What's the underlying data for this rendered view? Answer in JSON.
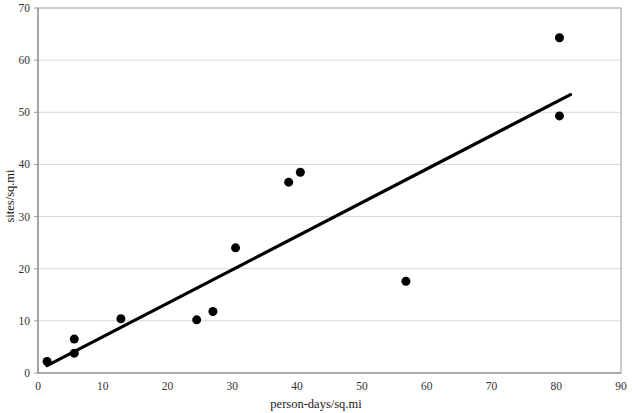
{
  "chart_data": {
    "type": "scatter",
    "title": "",
    "xlabel": "person-days/sq.mi",
    "ylabel": "sites/sq.mi",
    "xlim": [
      0,
      90
    ],
    "ylim": [
      0,
      70
    ],
    "xticks": [
      0,
      10,
      20,
      30,
      40,
      50,
      60,
      70,
      80,
      90
    ],
    "yticks": [
      0,
      10,
      20,
      30,
      40,
      50,
      60,
      70
    ],
    "xtick_labels": [
      "0",
      "10",
      "20",
      "30",
      "40",
      "50",
      "60",
      "70",
      "80",
      "90"
    ],
    "ytick_labels": [
      "0",
      "10",
      "20",
      "30",
      "40",
      "50",
      "60",
      "70"
    ],
    "grid": "horizontal",
    "legend": "none",
    "marker_color": "#000000",
    "marker_size": 9,
    "line_color": "#000000",
    "series": [
      {
        "name": "observations",
        "points": [
          {
            "x": 1.4,
            "y": 2.2
          },
          {
            "x": 5.6,
            "y": 6.5
          },
          {
            "x": 5.6,
            "y": 3.8
          },
          {
            "x": 12.8,
            "y": 10.4
          },
          {
            "x": 24.5,
            "y": 10.2
          },
          {
            "x": 27.0,
            "y": 11.8
          },
          {
            "x": 30.5,
            "y": 24.0
          },
          {
            "x": 38.7,
            "y": 36.6
          },
          {
            "x": 40.5,
            "y": 38.5
          },
          {
            "x": 56.8,
            "y": 17.6
          },
          {
            "x": 80.5,
            "y": 64.3
          },
          {
            "x": 80.5,
            "y": 49.3
          }
        ]
      }
    ],
    "trendline": {
      "name": "linear-fit",
      "x_start": 1.4,
      "y_start": 1.4,
      "x_end": 82.2,
      "y_end": 53.4
    }
  }
}
